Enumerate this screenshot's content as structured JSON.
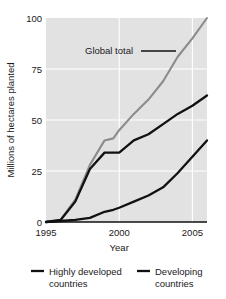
{
  "chart_data": {
    "type": "line",
    "title": "",
    "xlabel": "Year",
    "ylabel": "Millions of hectares planted",
    "xlim": [
      1995,
      2006
    ],
    "ylim": [
      0,
      100
    ],
    "xticks": [
      1995,
      2000,
      2005
    ],
    "xtick_labels": [
      "1995",
      "2000",
      "2005"
    ],
    "yticks": [
      0,
      25,
      50,
      75,
      100
    ],
    "ytick_labels": [
      "0",
      "25",
      "50",
      "75",
      "100"
    ],
    "grid": true,
    "grid_color": "#ffffff",
    "plot_background": "#e2e2e2",
    "legend_position": "below",
    "annotations": [
      {
        "text": "Global total",
        "x": 2002.0,
        "y": 84,
        "leader_to_x": 2004.4,
        "leader_to_y": 84
      }
    ],
    "x": [
      1995,
      1996,
      1997,
      1998,
      1999,
      1999.6,
      2000,
      2001,
      2002,
      2003,
      2004,
      2005,
      2006
    ],
    "series": [
      {
        "name": "Global total",
        "color": "#8c8c8c",
        "values": [
          0,
          1,
          11,
          28,
          40,
          41,
          45,
          53,
          60,
          69,
          81,
          90,
          100
        ]
      },
      {
        "name": "Highly developed countries",
        "color": "#111111",
        "values": [
          0,
          1,
          10,
          26,
          34,
          34,
          34,
          40,
          43,
          48,
          53,
          57,
          62
        ]
      },
      {
        "name": "Developing countries",
        "color": "#111111",
        "values": [
          0,
          0.5,
          1,
          2,
          5,
          6,
          7,
          10,
          13,
          17,
          24,
          32,
          40
        ]
      }
    ]
  },
  "legend": {
    "entries": [
      {
        "label_line1": "Highly developed",
        "label_line2": "countries",
        "color": "#111111",
        "swatch_width": 4
      },
      {
        "label_line1": "Developing",
        "label_line2": "countries",
        "color": "#111111",
        "swatch_width": 4
      }
    ]
  },
  "colors": {
    "global_total": "#8c8c8c",
    "highly_developed": "#111111",
    "developing": "#111111",
    "plot_bg": "#e2e2e2",
    "gridline": "#ffffff",
    "axis": "#111111",
    "text": "#1a1a1a",
    "page_bg": "#ffffff"
  }
}
